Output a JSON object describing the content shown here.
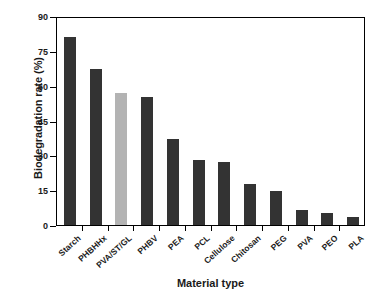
{
  "chart_data": {
    "type": "bar",
    "title": "",
    "xlabel": "Material type",
    "ylabel": "Biodegradation rate (%)",
    "categories": [
      "Starch",
      "PHBHHx",
      "PVA/ST/GL",
      "PHBV",
      "PEA",
      "PCL",
      "Cellulose",
      "Chitosan",
      "PEG",
      "PVA",
      "PEO",
      "PLA"
    ],
    "values": [
      81,
      67,
      57,
      55,
      37,
      28,
      27,
      17.5,
      14.5,
      6.5,
      5,
      3.5
    ],
    "bar_colors": [
      "#333333",
      "#333333",
      "#b3b3b3",
      "#333333",
      "#333333",
      "#333333",
      "#333333",
      "#333333",
      "#333333",
      "#333333",
      "#333333",
      "#333333"
    ],
    "ylim": [
      0,
      90
    ],
    "yticks": [
      0,
      15,
      30,
      45,
      60,
      75,
      90
    ],
    "ytick_labels": [
      "0",
      "15",
      "30",
      "45",
      "60",
      "75",
      "90"
    ],
    "grid": false,
    "legend": "none",
    "series": [
      {
        "name": "Biodegradation rate",
        "values": [
          81,
          67,
          57,
          55,
          37,
          28,
          27,
          17.5,
          14.5,
          6.5,
          5,
          3.5
        ]
      }
    ]
  },
  "colors": {
    "bar_dark": "#333333",
    "bar_light": "#b3b3b3",
    "axis": "#000000",
    "text": "#1a1a1a",
    "background": "#ffffff"
  }
}
